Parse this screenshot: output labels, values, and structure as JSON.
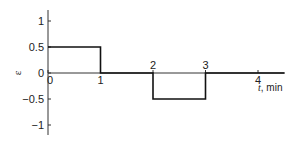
{
  "chart_data": {
    "type": "line",
    "step": true,
    "title": "",
    "xlabel": "t, min",
    "xlabel_var": "t",
    "xlabel_unit": ", min",
    "ylabel": "ε",
    "xlim": [
      0,
      4.5
    ],
    "ylim": [
      -1.2,
      1.2
    ],
    "x_ticks": [
      0,
      1,
      2,
      3,
      4
    ],
    "x_tick_labels": [
      "0",
      "1",
      "2",
      "3",
      "4"
    ],
    "y_ticks": [
      1,
      0.5,
      0,
      -0.5,
      -1
    ],
    "y_tick_labels": [
      "1",
      "0.5",
      "0",
      "-0.5",
      "-1"
    ],
    "grid": false,
    "legend": null,
    "series": [
      {
        "name": "ε(t)",
        "color": "#111111",
        "x": [
          0,
          1,
          1,
          2,
          2,
          3,
          3,
          4.5
        ],
        "y": [
          0.5,
          0.5,
          0,
          0,
          -0.5,
          -0.5,
          0,
          0
        ]
      }
    ]
  }
}
